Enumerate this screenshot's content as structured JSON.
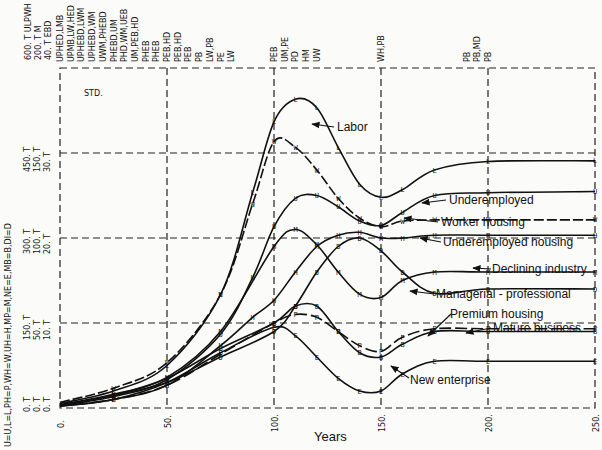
{
  "chart_data": {
    "type": "line",
    "title": "STD.",
    "xlabel": "Years",
    "x_ticks": [
      "0.",
      "50.",
      "100.",
      "150.",
      "200.",
      "250."
    ],
    "xlim": [
      0,
      250
    ],
    "y_scales": [
      {
        "name": "ULPWH",
        "ticks": [
          "0. T",
          "150. T",
          "300. T",
          "450. T",
          "600. T"
        ]
      },
      {
        "name": "M",
        "ticks": [
          "0. T",
          "50. T",
          "100. T",
          "150. T",
          "200. T"
        ]
      },
      {
        "name": "EBD",
        "ticks": [
          "0. T",
          "10. T",
          "20. T",
          "30. T",
          "40. T"
        ]
      }
    ],
    "y_scale_header": [
      "600. T ULPWH",
      "200. T M",
      "40. T EBD"
    ],
    "legend_key": "U=U,L=L,PH=P,WH=W,UH=H,MP=M,NE=E,MB=B,DI=D",
    "overlap_labels": [
      {
        "x": 0,
        "text": "UPHED,LMB"
      },
      {
        "x": 5,
        "text": "UPMB,LW,HED"
      },
      {
        "x": 10,
        "text": "UPHEBD,LWM"
      },
      {
        "x": 15,
        "text": "UPHEBD,WM"
      },
      {
        "x": 20,
        "text": "UWM,PHEBD"
      },
      {
        "x": 25,
        "text": "PHEBD,UM"
      },
      {
        "x": 30,
        "text": "PHD,WM,UEB"
      },
      {
        "x": 35,
        "text": "UM,PEB,HD"
      },
      {
        "x": 40,
        "text": "PHEB"
      },
      {
        "x": 45,
        "text": "PHEB"
      },
      {
        "x": 50,
        "text": "PEB,HD"
      },
      {
        "x": 55,
        "text": "PEB,HD"
      },
      {
        "x": 60,
        "text": "PEB"
      },
      {
        "x": 65,
        "text": "PB"
      },
      {
        "x": 70,
        "text": "LW,PB"
      },
      {
        "x": 75,
        "text": "PE"
      },
      {
        "x": 80,
        "text": "LW"
      },
      {
        "x": 100,
        "text": "PEB"
      },
      {
        "x": 105,
        "text": "UM,PE"
      },
      {
        "x": 110,
        "text": "PD"
      },
      {
        "x": 115,
        "text": "HM"
      },
      {
        "x": 120,
        "text": "UW"
      },
      {
        "x": 150,
        "text": "WH,PB"
      },
      {
        "x": 190,
        "text": "PB"
      },
      {
        "x": 195,
        "text": "PB,MD"
      },
      {
        "x": 200,
        "text": "PB"
      }
    ],
    "series": [
      {
        "name": "Labor",
        "marker": "L",
        "values_ulpwh_scale": [
          [
            0,
            8
          ],
          [
            25,
            30
          ],
          [
            50,
            75
          ],
          [
            75,
            200
          ],
          [
            90,
            380
          ],
          [
            100,
            505
          ],
          [
            110,
            545
          ],
          [
            120,
            530
          ],
          [
            130,
            460
          ],
          [
            140,
            395
          ],
          [
            150,
            372
          ],
          [
            160,
            385
          ],
          [
            175,
            420
          ],
          [
            200,
            435
          ],
          [
            250,
            436
          ]
        ]
      },
      {
        "name": "Underemployed",
        "marker": "U",
        "values_ulpwh_scale": [
          [
            0,
            5
          ],
          [
            25,
            20
          ],
          [
            50,
            50
          ],
          [
            75,
            130
          ],
          [
            90,
            230
          ],
          [
            100,
            320
          ],
          [
            110,
            370
          ],
          [
            120,
            375
          ],
          [
            130,
            355
          ],
          [
            140,
            330
          ],
          [
            150,
            322
          ],
          [
            160,
            345
          ],
          [
            175,
            375
          ],
          [
            200,
            380
          ],
          [
            250,
            382
          ]
        ]
      },
      {
        "name": "Worker housing",
        "marker": "W",
        "values_ulpwh_scale": [
          [
            0,
            10
          ],
          [
            25,
            35
          ],
          [
            50,
            80
          ],
          [
            75,
            200
          ],
          [
            90,
            360
          ],
          [
            100,
            470
          ],
          [
            110,
            460
          ],
          [
            120,
            420
          ],
          [
            130,
            370
          ],
          [
            140,
            335
          ],
          [
            150,
            320
          ],
          [
            160,
            330
          ],
          [
            175,
            332
          ],
          [
            200,
            332
          ],
          [
            250,
            332
          ]
        ]
      },
      {
        "name": "Underemployed housing",
        "marker": "H",
        "values_ulpwh_scale": [
          [
            0,
            3
          ],
          [
            25,
            15
          ],
          [
            50,
            40
          ],
          [
            75,
            110
          ],
          [
            90,
            160
          ],
          [
            100,
            190
          ],
          [
            110,
            240
          ],
          [
            120,
            285
          ],
          [
            130,
            305
          ],
          [
            140,
            310
          ],
          [
            150,
            300
          ],
          [
            160,
            300
          ],
          [
            175,
            305
          ],
          [
            200,
            305
          ],
          [
            250,
            305
          ]
        ]
      },
      {
        "name": "Declining industry",
        "marker": "D",
        "values_ebd_scale": [
          [
            0,
            0.3
          ],
          [
            25,
            1.5
          ],
          [
            50,
            3
          ],
          [
            75,
            6
          ],
          [
            100,
            9
          ],
          [
            110,
            12
          ],
          [
            120,
            16
          ],
          [
            130,
            19
          ],
          [
            140,
            20
          ],
          [
            150,
            18.5
          ],
          [
            160,
            16
          ],
          [
            175,
            13.5
          ],
          [
            200,
            14
          ],
          [
            250,
            14
          ]
        ]
      },
      {
        "name": "Managerial-professional",
        "marker": "M",
        "values_m_scale": [
          [
            0,
            2
          ],
          [
            25,
            8
          ],
          [
            50,
            18
          ],
          [
            75,
            45
          ],
          [
            100,
            95
          ],
          [
            110,
            105
          ],
          [
            120,
            96
          ],
          [
            130,
            80
          ],
          [
            140,
            67
          ],
          [
            150,
            65
          ],
          [
            160,
            75
          ],
          [
            175,
            80
          ],
          [
            200,
            80
          ],
          [
            250,
            80
          ]
        ]
      },
      {
        "name": "Premium housing",
        "marker": "P",
        "values_ulpwh_scale": [
          [
            0,
            4
          ],
          [
            25,
            15
          ],
          [
            50,
            40
          ],
          [
            75,
            95
          ],
          [
            100,
            150
          ],
          [
            110,
            165
          ],
          [
            120,
            160
          ],
          [
            130,
            135
          ],
          [
            140,
            110
          ],
          [
            150,
            100
          ],
          [
            160,
            125
          ],
          [
            175,
            140
          ],
          [
            200,
            140
          ],
          [
            250,
            140
          ]
        ]
      },
      {
        "name": "Mature business",
        "marker": "B",
        "values_ebd_scale": [
          [
            0,
            0.3
          ],
          [
            25,
            1.5
          ],
          [
            50,
            3.5
          ],
          [
            75,
            7
          ],
          [
            100,
            10
          ],
          [
            110,
            12
          ],
          [
            120,
            12
          ],
          [
            130,
            9
          ],
          [
            140,
            6.5
          ],
          [
            150,
            6
          ],
          [
            160,
            7.5
          ],
          [
            175,
            9
          ],
          [
            200,
            9
          ],
          [
            250,
            9
          ]
        ]
      },
      {
        "name": "New enterprise",
        "marker": "E",
        "values_ebd_scale": [
          [
            0,
            0.2
          ],
          [
            25,
            1
          ],
          [
            50,
            3
          ],
          [
            75,
            6.5
          ],
          [
            100,
            9.5
          ],
          [
            110,
            8.5
          ],
          [
            120,
            6
          ],
          [
            130,
            3.5
          ],
          [
            140,
            2
          ],
          [
            150,
            2
          ],
          [
            160,
            4
          ],
          [
            175,
            5.5
          ],
          [
            200,
            5.5
          ],
          [
            250,
            5.5
          ]
        ]
      }
    ]
  },
  "labels": {
    "std": "STD.",
    "xlabel": "Years",
    "legend_key": "U=U,L=L,PH=P,WH=W,UH=H,MP=M,NE=E,MB=B,DI=D",
    "scale_header": [
      "600. T ULPWH",
      "200. T M",
      "40. T EBD"
    ],
    "y_ticks_450": [
      "450. T",
      "150. T",
      "30. T"
    ],
    "y_ticks_300": [
      "300. T",
      "100. T",
      "20. T"
    ],
    "y_ticks_150": [
      "150. T",
      "50. T",
      "10. T"
    ],
    "y_ticks_0": [
      "0. T",
      "0. T",
      "0. T"
    ],
    "x_ticks": [
      "0.",
      "50.",
      "100.",
      "150.",
      "200.",
      "250."
    ],
    "curve_labels": {
      "labor": "Labor",
      "underemployed": "Underemployed",
      "worker_housing": "Worker housing",
      "underemployed_housing": "Underemployed housing",
      "declining_industry": "Declining industry",
      "managerial_professional": "Managerial - professional",
      "premium_housing": "Premium housing",
      "mature_business": "Mature business",
      "new_enterprise": "New enterprise"
    }
  }
}
